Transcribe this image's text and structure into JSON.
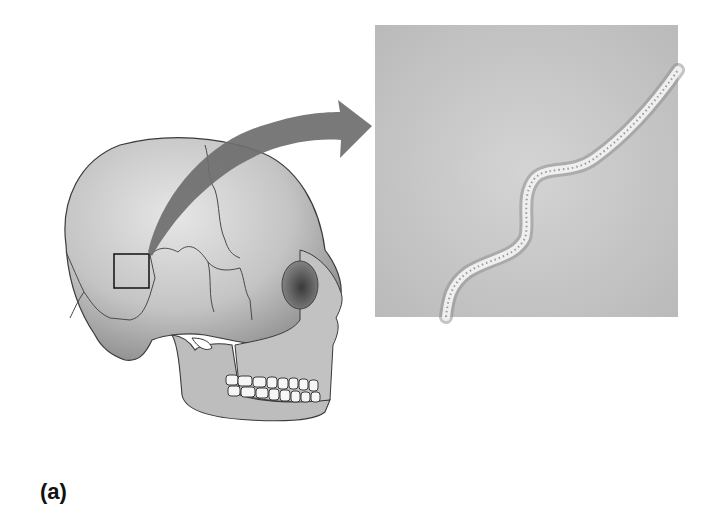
{
  "figure": {
    "panel_label": "(a)",
    "inset": "magnified-suture",
    "colors": {
      "background": "#ffffff",
      "bone": "#c8c8c8",
      "bone_shadow": "#8a8a8a",
      "arrow": "#6e6e6e",
      "inset_bg": "#c9c9c9",
      "suture_line": "#eeeeee",
      "outline": "#2a2a2a"
    }
  }
}
